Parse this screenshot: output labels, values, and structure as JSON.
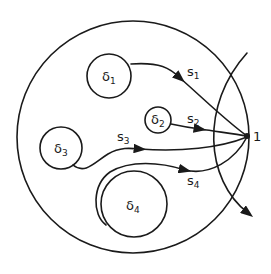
{
  "diagram": {
    "point": {
      "label": "1"
    },
    "obstacles": [
      {
        "id": "d1",
        "symbol": "δ",
        "index": "1"
      },
      {
        "id": "d2",
        "symbol": "δ",
        "index": "2"
      },
      {
        "id": "d3",
        "symbol": "δ",
        "index": "3"
      },
      {
        "id": "d4",
        "symbol": "δ",
        "index": "4"
      }
    ],
    "paths": [
      {
        "id": "s1",
        "symbol": "s",
        "index": "1"
      },
      {
        "id": "s2",
        "symbol": "s",
        "index": "2"
      },
      {
        "id": "s3",
        "symbol": "s",
        "index": "3"
      },
      {
        "id": "s4",
        "symbol": "s",
        "index": "4"
      }
    ],
    "colors": {
      "line": "#1a1a1a",
      "background": "#ffffff"
    }
  }
}
